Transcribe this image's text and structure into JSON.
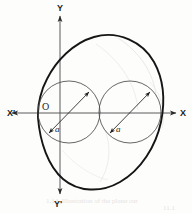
{
  "figure": {
    "background_color": "#fdfdfc",
    "ink_color": "#151515",
    "thin_ink_color": "#4a4a4a",
    "bleed_color": "#e2e0dd"
  },
  "axes": {
    "x_positive_label": "X",
    "x_negative_label": "X'",
    "y_positive_label": "Y",
    "y_negative_label": "Y'",
    "origin_label": "O",
    "origin_x": 38,
    "origin_y": 113,
    "x_axis_from": 10,
    "x_axis_to": 178,
    "y_axis_from": 14,
    "y_axis_to": 196
  },
  "curves": {
    "cardioid": {
      "name": "cardioid",
      "cusp_x": 38,
      "cusp_y": 113,
      "rightmost_x": 162,
      "top_y": 35,
      "bottom_y": 191,
      "stroke_width": 1.9
    },
    "circle_left": {
      "name": "left-inscribed-circle",
      "center_x": 69,
      "center_y": 112,
      "radius": 31,
      "stroke_width": 0.8
    },
    "circle_right": {
      "name": "right-inscribed-circle",
      "center_x": 130,
      "center_y": 112,
      "radius": 31,
      "stroke_width": 0.8
    }
  },
  "measures": [
    {
      "label": "a",
      "name": "left-diameter-measure",
      "label_x": 57,
      "label_y": 129,
      "arrow_x1": 48,
      "arrow_y1": 133,
      "arrow_x2": 90,
      "arrow_y2": 92
    },
    {
      "label": "a",
      "name": "right-diameter-measure",
      "label_x": 118,
      "label_y": 129,
      "arrow_x1": 109,
      "arrow_y1": 133,
      "arrow_x2": 151,
      "arrow_y2": 92
    }
  ],
  "bleed_through": {
    "caption_fragment": "1.14. Illustration of the plane cur",
    "page_fragment": "11.1"
  }
}
